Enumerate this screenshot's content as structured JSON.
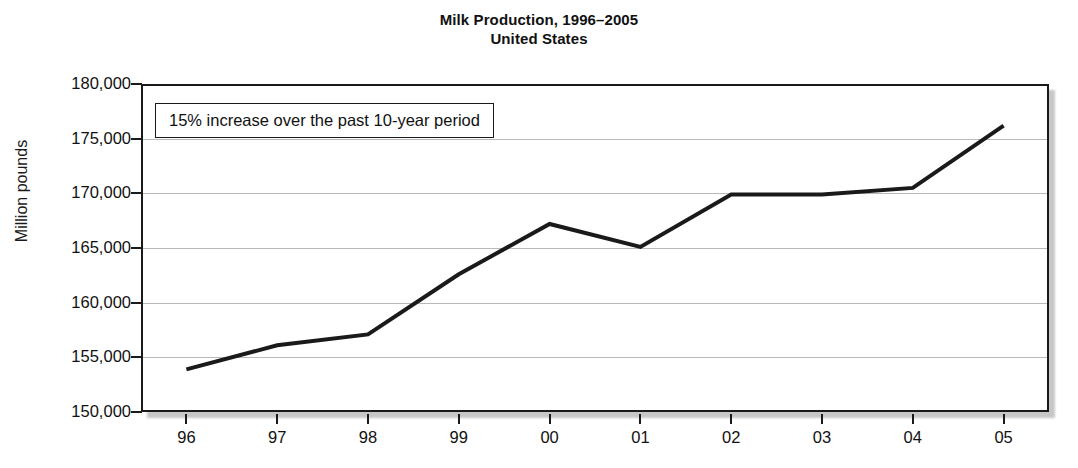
{
  "chart_data": {
    "type": "line",
    "title": "Milk Production, 1996–2005",
    "subtitle": "United States",
    "xlabel": "",
    "ylabel": "Million pounds",
    "categories": [
      "96",
      "97",
      "98",
      "99",
      "00",
      "01",
      "02",
      "03",
      "04",
      "05"
    ],
    "years": [
      1996,
      1997,
      1998,
      1999,
      2000,
      2001,
      2002,
      2003,
      2004,
      2005
    ],
    "values": [
      153900,
      156100,
      157100,
      162600,
      167200,
      165100,
      169900,
      169900,
      170500,
      176200
    ],
    "ylim": [
      150000,
      180000
    ],
    "ytick_values": [
      150000,
      155000,
      160000,
      165000,
      170000,
      175000,
      180000
    ],
    "ytick_labels": [
      "150,000",
      "155,000",
      "160,000",
      "165,000",
      "170,000",
      "175,000",
      "180,000"
    ],
    "grid": true,
    "legend": false,
    "legend_position": "none",
    "series": [
      {
        "name": "Milk production",
        "values": [
          153900,
          156100,
          157100,
          162600,
          167200,
          165100,
          169900,
          169900,
          170500,
          176200
        ],
        "color": "#1a1a1a",
        "line_width": 4
      }
    ],
    "annotations": [
      {
        "text": "15% increase over the past 10-year period",
        "type": "text-box",
        "x_category": "96",
        "y_value": 176500
      }
    ]
  },
  "colors": {
    "line": "#1a1a1a",
    "gridline": "#b9b9b9",
    "frame": "#1a1a1a",
    "background": "#ffffff",
    "text": "#111111"
  }
}
